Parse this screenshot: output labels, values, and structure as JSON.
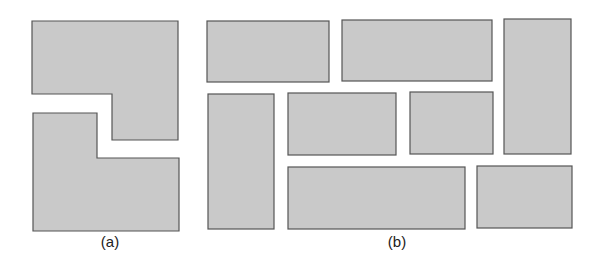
{
  "colors": {
    "fill": "#c9c9c9",
    "stroke": "#555555",
    "background": "#ffffff"
  },
  "panels": [
    {
      "id": "a",
      "label": "(a)",
      "label_pos": [
        110,
        233
      ],
      "shapes": [
        {
          "name": "top-l-shape",
          "points": "32,21 178,21 178,140 112,140 112,94 32,94"
        },
        {
          "name": "bottom-l-shape",
          "points": "33,113 97,113 97,158 179,158 179,231 33,231"
        }
      ]
    },
    {
      "id": "b",
      "label": "(b)",
      "label_pos": [
        397,
        233
      ],
      "rects": [
        {
          "x": 207,
          "y": 21,
          "w": 122,
          "h": 61
        },
        {
          "x": 342,
          "y": 20,
          "w": 150,
          "h": 61
        },
        {
          "x": 504,
          "y": 19,
          "w": 67,
          "h": 135
        },
        {
          "x": 208,
          "y": 94,
          "w": 66,
          "h": 135
        },
        {
          "x": 288,
          "y": 93,
          "w": 108,
          "h": 62
        },
        {
          "x": 410,
          "y": 92,
          "w": 83,
          "h": 62
        },
        {
          "x": 288,
          "y": 167,
          "w": 177,
          "h": 62
        },
        {
          "x": 477,
          "y": 166,
          "w": 95,
          "h": 62
        }
      ]
    }
  ]
}
